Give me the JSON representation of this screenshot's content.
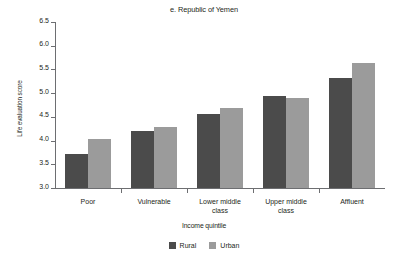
{
  "chart_data": {
    "type": "bar",
    "title": "e. Republic of Yemen",
    "xlabel": "Income quintile",
    "ylabel": "Life evaluation score",
    "categories": [
      "Poor",
      "Vulnerable",
      "Lower middle class",
      "Upper middle class",
      "Affluent"
    ],
    "category_lines": [
      [
        "Poor"
      ],
      [
        "Vulnerable"
      ],
      [
        "Lower middle",
        "class"
      ],
      [
        "Upper middle",
        "class"
      ],
      [
        "Affluent"
      ]
    ],
    "series": [
      {
        "name": "Rural",
        "color": "#4b4b4b",
        "values": [
          3.72,
          4.21,
          4.57,
          4.95,
          5.32
        ]
      },
      {
        "name": "Urban",
        "color": "#9b9b9b",
        "values": [
          4.04,
          4.28,
          4.68,
          4.9,
          5.63
        ]
      }
    ],
    "ylim": [
      3.0,
      6.5
    ],
    "ytick_step": 0.5,
    "yticks": [
      6.5,
      6.0,
      5.5,
      5.0,
      4.5,
      4.0,
      3.5,
      3.0
    ],
    "ytick_labels": [
      "6.5",
      "6.0",
      "5.5",
      "5.0",
      "4.5",
      "4.0",
      "3.5",
      "3.0"
    ],
    "grid": false,
    "legend_position": "bottom"
  },
  "legend": {
    "items": [
      {
        "label": "Rural",
        "color": "#4b4b4b"
      },
      {
        "label": "Urban",
        "color": "#9b9b9b"
      }
    ]
  },
  "colors": {
    "rural": "#4b4b4b",
    "urban": "#9b9b9b",
    "axis": "#6d6e71",
    "text": "#231f20",
    "background": "#ffffff"
  }
}
